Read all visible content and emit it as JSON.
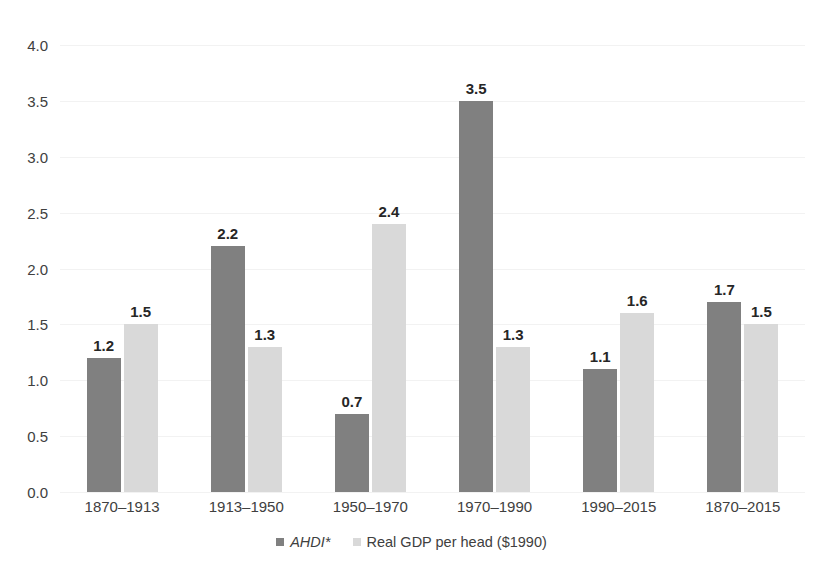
{
  "chart_data": {
    "type": "bar",
    "title": "",
    "subtitle": "",
    "xlabel": "",
    "ylabel": "",
    "ylim": [
      0,
      4.0
    ],
    "ytick_step": 0.5,
    "ytick_labels": [
      "4.0",
      "3.5",
      "3.0",
      "2.5",
      "2.0",
      "1.5",
      "1.0",
      "0.5",
      "0.0"
    ],
    "ytick_values": [
      4.0,
      3.5,
      3.0,
      2.5,
      2.0,
      1.5,
      1.0,
      0.5,
      0.0
    ],
    "grid": true,
    "grid_axis": "y",
    "legend_position": "bottom-center",
    "categories": [
      "1870–1913",
      "1913–1950",
      "1950–1970",
      "1970–1990",
      "1990–2015",
      "1870–2015"
    ],
    "series": [
      {
        "name": "AHDI*",
        "italic": true,
        "color": "#808080",
        "values": [
          1.2,
          2.2,
          0.7,
          3.5,
          1.1,
          1.7
        ],
        "labels": [
          "1.2",
          "2.2",
          "0.7",
          "3.5",
          "1.1",
          "1.7"
        ]
      },
      {
        "name": "Real GDP per head ($1990)",
        "italic": false,
        "color": "#d9d9d9",
        "values": [
          1.5,
          1.3,
          2.4,
          1.3,
          1.6,
          1.5
        ],
        "labels": [
          "1.5",
          "1.3",
          "2.4",
          "1.3",
          "1.6",
          "1.5"
        ]
      }
    ],
    "colors": {
      "series_ahdi": "#808080",
      "series_gdp": "#d9d9d9",
      "gridline": "#f2f2f2",
      "axis_text": "#404040",
      "data_label_text": "#262626",
      "background": "#ffffff"
    }
  }
}
